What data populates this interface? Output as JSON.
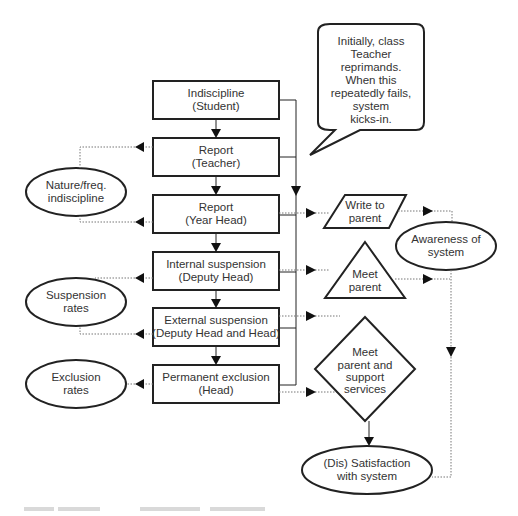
{
  "diagram": {
    "process_boxes": [
      {
        "id": "indiscipline",
        "line1": "Indiscipline",
        "line2": "(Student)"
      },
      {
        "id": "report-teacher",
        "line1": "Report",
        "line2": "(Teacher)"
      },
      {
        "id": "report-year-head",
        "line1": "Report",
        "line2": "(Year Head)"
      },
      {
        "id": "internal-suspension",
        "line1": "Internal suspension",
        "line2": "(Deputy Head)"
      },
      {
        "id": "external-suspension",
        "line1": "External suspension",
        "line2": "(Deputy Head and Head)"
      },
      {
        "id": "permanent-exclusion",
        "line1": "Permanent exclusion",
        "line2": "(Head)"
      }
    ],
    "left_ellipses": [
      {
        "id": "nature-freq",
        "line1": "Nature/freq.",
        "line2": "indiscipline"
      },
      {
        "id": "suspension-rates",
        "line1": "Suspension",
        "line2": "rates"
      },
      {
        "id": "exclusion-rates",
        "line1": "Exclusion",
        "line2": "rates"
      }
    ],
    "right_shapes": {
      "write_to_parent": {
        "line1": "Write to",
        "line2": "parent"
      },
      "meet_parent": {
        "line1": "Meet",
        "line2": "parent"
      },
      "meet_support": {
        "line1": "Meet",
        "line2": "parent and",
        "line3": "support",
        "line4": "services"
      },
      "awareness": {
        "line1": "Awareness of",
        "line2": "system"
      },
      "satisfaction": {
        "line1": "(Dis) Satisfaction",
        "line2": "with system"
      }
    },
    "callout": {
      "lines": [
        "Initially, class",
        "Teacher",
        "reprimands.",
        "When this",
        "repeatedly fails,",
        "system",
        "kicks-in."
      ]
    }
  }
}
